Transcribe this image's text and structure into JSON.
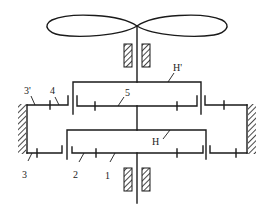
{
  "diagram": {
    "type": "planetary gear train schematic with propeller",
    "labels": {
      "carrier_upper": "H'",
      "carrier_lower": "H",
      "gear_1": "1",
      "gear_2": "2",
      "gear_3": "3",
      "gear_3_prime": "3'",
      "gear_4": "4",
      "gear_5": "5"
    },
    "components": [
      {
        "id": "propeller",
        "description": "two-lobed propeller at top of output shaft"
      },
      {
        "id": "bearing-top",
        "description": "hatched bearing pair on upper shaft"
      },
      {
        "id": "carrier-H-prime",
        "description": "upper planet carrier H'"
      },
      {
        "id": "gear-5",
        "description": "upper sun gear 5"
      },
      {
        "id": "gear-4",
        "description": "upper planet gear 4"
      },
      {
        "id": "gear-3-prime",
        "description": "fixed ring gear 3'"
      },
      {
        "id": "carrier-H",
        "description": "lower planet carrier H"
      },
      {
        "id": "gear-1",
        "description": "lower sun gear 1 on input shaft"
      },
      {
        "id": "gear-2",
        "description": "lower planet gear 2"
      },
      {
        "id": "gear-3",
        "description": "fixed ring gear 3"
      },
      {
        "id": "frame",
        "description": "hatched ground/frame on left and right"
      },
      {
        "id": "bearing-bottom",
        "description": "hatched bearing pair on input shaft"
      }
    ],
    "colors": {
      "stroke": "#1a1a1a",
      "background": "#ffffff"
    }
  }
}
